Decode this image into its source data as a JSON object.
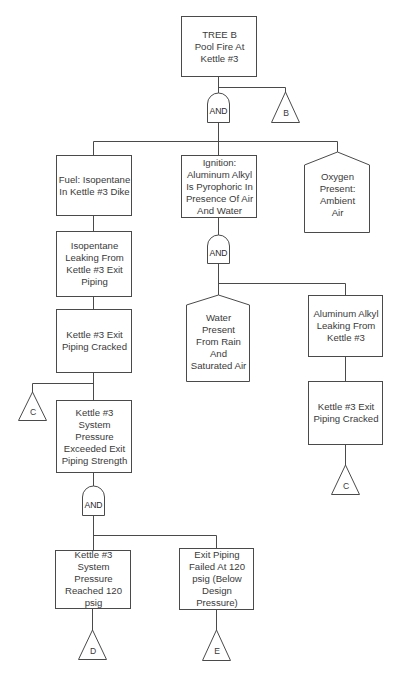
{
  "diagram": {
    "type": "fault-tree",
    "colors": {
      "line": "#4a4a4a",
      "text": "#3a3a3a",
      "background": "#ffffff"
    },
    "top_event": {
      "id": "top",
      "shape": "rectangle",
      "label": "TREE B\nPool Fire At\nKettle #3"
    },
    "transfers": {
      "B": {
        "label": "B"
      },
      "C_left": {
        "label": "C"
      },
      "C_right": {
        "label": "C"
      },
      "D": {
        "label": "D"
      },
      "E": {
        "label": "E"
      }
    },
    "gates": {
      "and_top": {
        "label": "AND"
      },
      "and_ignition": {
        "label": "AND"
      },
      "and_pressure": {
        "label": "AND"
      }
    },
    "events": {
      "fuel": {
        "shape": "rectangle",
        "label": "Fuel: Isopentane\nIn Kettle #3 Dike"
      },
      "ignition": {
        "shape": "rectangle",
        "label": "Ignition:\nAluminum Alkyl\nIs Pyrophoric In\nPresence Of Air\nAnd Water"
      },
      "oxygen": {
        "shape": "house",
        "label": "Oxygen\nPresent:\nAmbient\nAir"
      },
      "isopentane_leak": {
        "shape": "rectangle",
        "label": "Isopentane\nLeaking From\nKettle #3 Exit\nPiping"
      },
      "piping_cracked_left": {
        "shape": "rectangle",
        "label": "Kettle #3 Exit\nPiping Cracked"
      },
      "pressure_exceeded": {
        "shape": "rectangle",
        "label": "Kettle #3\nSystem\nPressure\nExceeded Exit\nPiping Strength"
      },
      "pressure_reached": {
        "shape": "rectangle",
        "label": "Kettle #3\nSystem\nPressure\nReached 120\npsig"
      },
      "piping_failed": {
        "shape": "rectangle",
        "label": "Exit Piping\nFailed At 120\npsig (Below\nDesign\nPressure)"
      },
      "water": {
        "shape": "house",
        "label": "Water\nPresent\nFrom Rain\nAnd\nSaturated Air"
      },
      "alkyl_leak": {
        "shape": "rectangle",
        "label": "Aluminum Alkyl\nLeaking From\nKettle #3"
      },
      "piping_cracked_right": {
        "shape": "rectangle",
        "label": "Kettle #3 Exit\nPiping Cracked"
      }
    }
  }
}
